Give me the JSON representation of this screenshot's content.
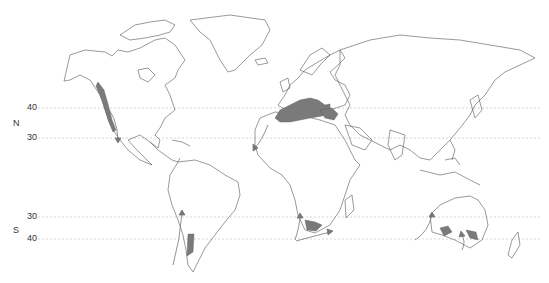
{
  "map": {
    "type": "world outline map",
    "description": "Mediterranean climate regions shaded gray, with ocean current arrows",
    "colors": {
      "coastline": "#555555",
      "shaded_region": "#7a7a7a",
      "gridline": "#cccccc",
      "arrow": "#777777"
    },
    "latitudes": [
      {
        "label": "40",
        "hemisphere": "N",
        "y": 108
      },
      {
        "label": "30",
        "hemisphere": "N",
        "y": 138
      },
      {
        "label": "30",
        "hemisphere": "S",
        "y": 217
      },
      {
        "label": "40",
        "hemisphere": "S",
        "y": 239
      }
    ],
    "hemisphere_labels": {
      "north": "N",
      "south": "S"
    },
    "shaded_regions": [
      "California",
      "Mediterranean Basin",
      "Central Chile",
      "South Africa Cape",
      "Southwest Australia",
      "South Australia"
    ]
  }
}
